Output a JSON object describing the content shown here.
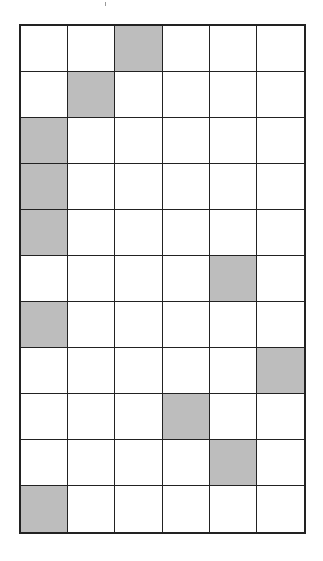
{
  "grid": {
    "rows": 11,
    "cols": 6,
    "shaded_color": "#bdbdbd",
    "line_color": "#222222",
    "cells": [
      [
        0,
        0,
        1,
        0,
        0,
        0
      ],
      [
        0,
        1,
        0,
        0,
        0,
        0
      ],
      [
        1,
        0,
        0,
        0,
        0,
        0
      ],
      [
        1,
        0,
        0,
        0,
        0,
        0
      ],
      [
        1,
        0,
        0,
        0,
        0,
        0
      ],
      [
        0,
        0,
        0,
        0,
        1,
        0
      ],
      [
        1,
        0,
        0,
        0,
        0,
        0
      ],
      [
        0,
        0,
        0,
        0,
        0,
        1
      ],
      [
        0,
        0,
        0,
        1,
        0,
        0
      ],
      [
        0,
        0,
        0,
        0,
        1,
        0
      ],
      [
        1,
        0,
        0,
        0,
        0,
        0
      ]
    ]
  }
}
